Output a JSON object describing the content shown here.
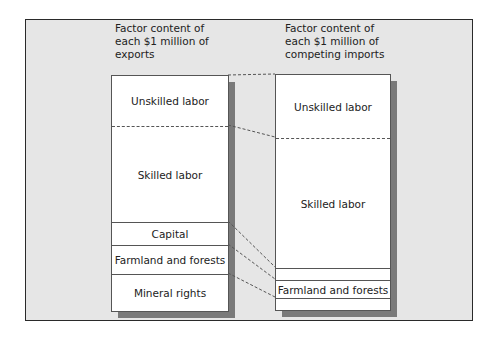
{
  "diagram": {
    "exports": {
      "heading": "Factor content of each $1 million of exports",
      "heading_lines": [
        "Factor content of",
        "each $1 million of",
        "exports"
      ],
      "segments": [
        {
          "label": "Unskilled labor",
          "top": 0,
          "height": 50
        },
        {
          "label": "Skilled labor",
          "top": 50,
          "height": 96
        },
        {
          "label": "Capital",
          "top": 146,
          "height": 23
        },
        {
          "label": "Farmland and forests",
          "top": 169,
          "height": 29
        },
        {
          "label": "Mineral rights",
          "top": 198,
          "height": 38
        }
      ]
    },
    "imports": {
      "heading": "Factor content of each $1 million of competing imports",
      "heading_lines": [
        "Factor content of",
        "each $1 million of",
        "competing imports"
      ],
      "segments": [
        {
          "label": "Unskilled labor",
          "top": 0,
          "height": 63
        },
        {
          "label": "Skilled labor",
          "top": 63,
          "height": 130
        },
        {
          "label": "",
          "top": 193,
          "height": 12
        },
        {
          "label": "Farmland and forests",
          "top": 205,
          "height": 18
        },
        {
          "label": "",
          "top": 223,
          "height": 13
        }
      ]
    },
    "colors": {
      "background": "#e6e6e6",
      "box_fill": "#ffffff",
      "shadow": "#7a7a7a",
      "border": "#555555"
    }
  }
}
